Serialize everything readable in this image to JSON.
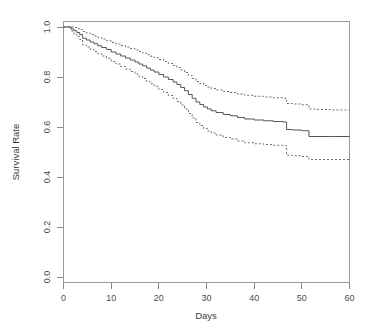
{
  "chart_data": {
    "type": "line",
    "title": "",
    "subtitle": "",
    "xlabel": "Days",
    "ylabel": "Survival Rate",
    "xlim": [
      0,
      60
    ],
    "ylim": [
      0.0,
      1.0
    ],
    "xticks": [
      0,
      10,
      20,
      30,
      40,
      50,
      60
    ],
    "xtick_labels": [
      "0",
      "10",
      "20",
      "30",
      "40",
      "50",
      "60"
    ],
    "yticks": [
      0.0,
      0.2,
      0.4,
      0.6,
      0.8,
      1.0
    ],
    "ytick_labels": [
      "0.0",
      "0.2",
      "0.4",
      "0.6",
      "0.8",
      "1.0"
    ],
    "grid": false,
    "legend": null,
    "legend_position": "none",
    "step_style": "post",
    "annotations": [],
    "series": [
      {
        "name": "Survival estimate",
        "style": "solid",
        "color": "#555555",
        "x": [
          0,
          1.0,
          1.6,
          2.2,
          2.8,
          3.4,
          4.0,
          4.8,
          5.6,
          6.4,
          7.2,
          8.0,
          9.0,
          10.0,
          11.0,
          12.0,
          13.0,
          14.0,
          15.0,
          15.8,
          16.6,
          17.4,
          18.2,
          19.0,
          20.0,
          21.0,
          22.0,
          23.0,
          23.8,
          24.6,
          25.4,
          26.2,
          27.0,
          27.8,
          28.6,
          29.4,
          30.2,
          31.0,
          32.0,
          33.5,
          35.0,
          36.5,
          38.0,
          40.0,
          42.0,
          44.0,
          46.0,
          46.8,
          48.0,
          50.0,
          51.5,
          53.0,
          56.0,
          60.0
        ],
        "y": [
          1.0,
          1.0,
          0.992,
          0.985,
          0.978,
          0.97,
          0.955,
          0.948,
          0.94,
          0.933,
          0.925,
          0.918,
          0.91,
          0.9,
          0.892,
          0.884,
          0.876,
          0.868,
          0.86,
          0.852,
          0.845,
          0.836,
          0.828,
          0.82,
          0.81,
          0.8,
          0.79,
          0.78,
          0.77,
          0.758,
          0.745,
          0.73,
          0.715,
          0.7,
          0.69,
          0.68,
          0.672,
          0.665,
          0.658,
          0.65,
          0.645,
          0.638,
          0.632,
          0.628,
          0.625,
          0.622,
          0.62,
          0.59,
          0.588,
          0.585,
          0.562,
          0.562,
          0.562,
          0.562
        ]
      },
      {
        "name": "Upper 95% confidence limit",
        "style": "dotted",
        "color": "#6b6b6b",
        "x": [
          0,
          1.0,
          1.6,
          2.2,
          2.8,
          3.4,
          4.0,
          4.8,
          5.6,
          6.4,
          7.2,
          8.0,
          9.0,
          10.0,
          11.0,
          12.0,
          13.0,
          14.0,
          15.0,
          15.8,
          16.6,
          17.4,
          18.2,
          19.0,
          20.0,
          21.0,
          22.0,
          23.0,
          23.8,
          24.6,
          25.4,
          26.2,
          27.0,
          27.8,
          28.6,
          29.4,
          30.2,
          31.0,
          32.0,
          33.5,
          35.0,
          36.5,
          38.0,
          40.0,
          42.0,
          44.0,
          46.0,
          46.8,
          48.0,
          50.0,
          51.5,
          53.0,
          56.0,
          60.0
        ],
        "y": [
          1.0,
          1.0,
          1.0,
          0.998,
          0.994,
          0.99,
          0.982,
          0.976,
          0.97,
          0.964,
          0.958,
          0.952,
          0.945,
          0.938,
          0.932,
          0.926,
          0.92,
          0.914,
          0.908,
          0.902,
          0.896,
          0.889,
          0.883,
          0.877,
          0.87,
          0.862,
          0.854,
          0.846,
          0.838,
          0.828,
          0.818,
          0.806,
          0.794,
          0.782,
          0.774,
          0.766,
          0.76,
          0.754,
          0.748,
          0.742,
          0.738,
          0.732,
          0.727,
          0.723,
          0.72,
          0.717,
          0.715,
          0.694,
          0.692,
          0.689,
          0.672,
          0.67,
          0.668,
          0.667
        ]
      },
      {
        "name": "Lower 95% confidence limit",
        "style": "dotted",
        "color": "#6b6b6b",
        "x": [
          0,
          1.0,
          1.6,
          2.2,
          2.8,
          3.4,
          4.0,
          4.8,
          5.6,
          6.4,
          7.2,
          8.0,
          9.0,
          10.0,
          11.0,
          12.0,
          13.0,
          14.0,
          15.0,
          15.8,
          16.6,
          17.4,
          18.2,
          19.0,
          20.0,
          21.0,
          22.0,
          23.0,
          23.8,
          24.6,
          25.4,
          26.2,
          27.0,
          27.8,
          28.6,
          29.4,
          30.2,
          31.0,
          32.0,
          33.5,
          35.0,
          36.5,
          38.0,
          40.0,
          42.0,
          44.0,
          46.0,
          46.8,
          48.0,
          50.0,
          51.5,
          53.0,
          56.0,
          60.0
        ],
        "y": [
          1.0,
          1.0,
          0.984,
          0.972,
          0.962,
          0.95,
          0.928,
          0.92,
          0.911,
          0.902,
          0.893,
          0.884,
          0.875,
          0.862,
          0.852,
          0.842,
          0.832,
          0.822,
          0.812,
          0.802,
          0.794,
          0.783,
          0.773,
          0.763,
          0.75,
          0.738,
          0.726,
          0.714,
          0.702,
          0.688,
          0.672,
          0.654,
          0.636,
          0.618,
          0.606,
          0.594,
          0.584,
          0.576,
          0.568,
          0.558,
          0.552,
          0.544,
          0.537,
          0.533,
          0.53,
          0.527,
          0.525,
          0.487,
          0.485,
          0.482,
          0.47,
          0.47,
          0.47,
          0.47
        ]
      }
    ]
  },
  "axes": {
    "x_axis_title": "Days",
    "y_axis_title": "Survival Rate"
  }
}
